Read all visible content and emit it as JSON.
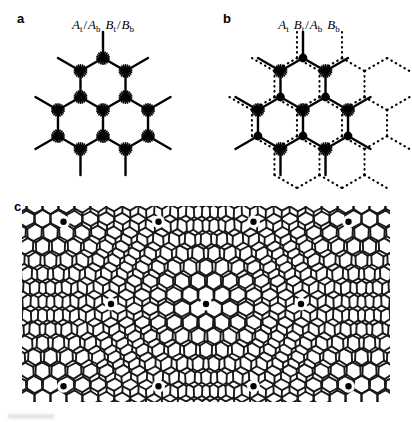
{
  "figure": {
    "panels": [
      {
        "id": "a",
        "letter": "a",
        "label_plain": "At/Ab Bt/Bb",
        "label_parts": [
          {
            "italic": "A",
            "sub": "t"
          },
          {
            "sep": "/"
          },
          {
            "italic": "A",
            "sub": "b"
          },
          {
            "gap": true
          },
          {
            "italic": "B",
            "sub": "t"
          },
          {
            "sep": "/"
          },
          {
            "italic": "B",
            "sub": "b"
          }
        ],
        "stacking": "AA",
        "description": "AA stacking: top and bottom honeycomb layers perfectly superposed; every site is a star (overlapping atoms)."
      },
      {
        "id": "b",
        "letter": "b",
        "label_plain": "At Bt/Ab Bb",
        "label_parts": [
          {
            "italic": "A",
            "sub": "t"
          },
          {
            "gap": true
          },
          {
            "italic": "B",
            "sub": "t"
          },
          {
            "sep": "/"
          },
          {
            "italic": "A",
            "sub": "b"
          },
          {
            "gap": true
          },
          {
            "italic": "B",
            "sub": "b"
          }
        ],
        "stacking": "AB",
        "description": "AB (Bernal) stacking: solid layer drawn with star and filled-circle sites, dotted layer shifted by one bond length."
      },
      {
        "id": "c",
        "letter": "c",
        "label_plain": "",
        "label_parts": [],
        "stacking": "twisted moire",
        "description": "Twisted bilayer: two honeycomb lattices rotated by a small angle producing a triangular moire superlattice; AA-stacked centres marked with filled dots."
      }
    ]
  },
  "chart_data": {
    "type": "diagram",
    "title": "",
    "panels": [
      {
        "id": "a",
        "type": "honeycomb-lattice-overlay",
        "stacking": "AA",
        "twist_angle_deg": 0,
        "layers": [
          {
            "name": "top",
            "style": "solid",
            "offset": [
              0,
              0
            ]
          },
          {
            "name": "bottom",
            "style": "solid",
            "offset": [
              0,
              0
            ]
          }
        ],
        "bond_length_px": 26,
        "center_px": [
          103,
          110
        ],
        "rings": 1,
        "site_marker": "star",
        "site_types": [
          "A",
          "B"
        ],
        "line_width_px": 2.4,
        "color": "#000000"
      },
      {
        "id": "b",
        "type": "honeycomb-lattice-overlay",
        "stacking": "AB",
        "twist_angle_deg": 0,
        "layers": [
          {
            "name": "solid",
            "style": "solid",
            "offset": [
              0,
              0
            ]
          },
          {
            "name": "shifted",
            "style": "dotted",
            "offset": [
              26,
              0
            ]
          }
        ],
        "bond_length_px": 26,
        "center_px": [
          97,
          110
        ],
        "rings": 1,
        "site_marker_A": "star",
        "site_marker_B": "filled-circle",
        "line_width_px": 2.4,
        "color": "#000000"
      },
      {
        "id": "c",
        "type": "moire-superlattice",
        "stacking": "twisted",
        "twist_angle_deg": 5.0,
        "layers": [
          {
            "name": "layer-1",
            "style": "solid",
            "rotation_deg": -2.5
          },
          {
            "name": "layer-2",
            "style": "solid",
            "rotation_deg": 2.5
          }
        ],
        "bond_length_px": 9.2,
        "line_width_px": 1.9,
        "color": "#1a1a1a",
        "aa_marker": "filled-dot",
        "aa_marker_radius_px": 3.2,
        "aa_spot_count": 13,
        "moire_period_px": 95,
        "bounds_px": {
          "x": 22,
          "y": 10,
          "width": 368,
          "height": 196
        }
      }
    ],
    "axis": {
      "grid": false,
      "xlabel": "",
      "ylabel": ""
    },
    "legend": {
      "entries": [],
      "position": "none"
    },
    "colors": {
      "ink": "#000000",
      "background": "#ffffff"
    }
  }
}
